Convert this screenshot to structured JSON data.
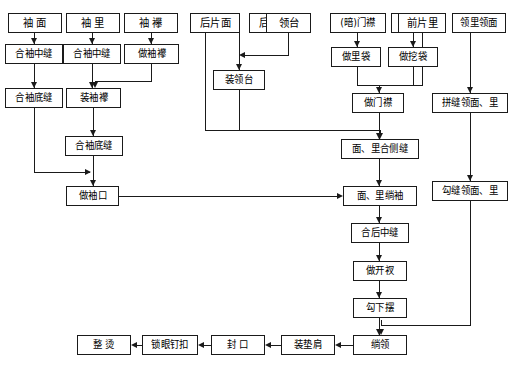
{
  "diagram": {
    "type": "flowchart",
    "orientation": "top-to-bottom",
    "line_color": "#1a1a1a",
    "box_fill": "#ffffff",
    "nodes": [
      {
        "id": "n01",
        "label": "袖 面",
        "x": 8,
        "y": 13,
        "w": 54,
        "h": 20,
        "fs": 11
      },
      {
        "id": "n02",
        "label": "袖 里",
        "x": 66,
        "y": 13,
        "w": 54,
        "h": 20,
        "fs": 11
      },
      {
        "id": "n03",
        "label": "袖 襻",
        "x": 124,
        "y": 13,
        "w": 54,
        "h": 20,
        "fs": 11
      },
      {
        "id": "n04",
        "label": "后片面",
        "x": 190,
        "y": 13,
        "w": 50,
        "h": 20,
        "fs": 11
      },
      {
        "id": "n05",
        "label": "后片里",
        "x": 249,
        "y": 13,
        "w": 50,
        "h": 20,
        "fs": 11
      },
      {
        "id": "n06",
        "label": "领台",
        "x": 307,
        "y": 13,
        "w": 45,
        "h": 20,
        "fs": 11
      },
      {
        "id": "n07",
        "label": "(暗)门襟",
        "x": 332,
        "y": 13,
        "w": 56,
        "h": 20,
        "fs": 10
      },
      {
        "id": "n08",
        "label": "前片面",
        "x": 395,
        "y": 13,
        "w": 50,
        "h": 20,
        "fs": 11
      },
      {
        "id": "n09",
        "label": "前片里",
        "x": 452,
        "y": 13,
        "w": 50,
        "h": 20,
        "fs": 11
      },
      {
        "id": "n10",
        "label": "领里领面",
        "x": 455,
        "y": 13,
        "w": 53,
        "h": 20,
        "fs": 10
      },
      {
        "id": "n11",
        "label": "合袖中缝",
        "x": 5,
        "y": 44,
        "w": 58,
        "h": 20,
        "fs": 10
      },
      {
        "id": "n12",
        "label": "合袖中缝",
        "x": 63,
        "y": 44,
        "w": 58,
        "h": 20,
        "fs": 10
      },
      {
        "id": "n13",
        "label": "做袖襻",
        "x": 124,
        "y": 44,
        "w": 55,
        "h": 20,
        "fs": 10
      },
      {
        "id": "n14",
        "label": "做里袋",
        "x": 333,
        "y": 47,
        "w": 50,
        "h": 20,
        "fs": 10
      },
      {
        "id": "n15",
        "label": "做挖袋",
        "x": 390,
        "y": 47,
        "w": 50,
        "h": 20,
        "fs": 10
      },
      {
        "id": "n16",
        "label": "装领台",
        "x": 213,
        "y": 70,
        "w": 52,
        "h": 20,
        "fs": 10
      },
      {
        "id": "n17",
        "label": "合袖底缝",
        "x": 5,
        "y": 88,
        "w": 58,
        "h": 20,
        "fs": 10
      },
      {
        "id": "n18",
        "label": "装袖襻",
        "x": 66,
        "y": 88,
        "w": 55,
        "h": 20,
        "fs": 10
      },
      {
        "id": "n19",
        "label": "做门襟",
        "x": 352,
        "y": 93,
        "w": 52,
        "h": 20,
        "fs": 10
      },
      {
        "id": "n20",
        "label": "拼缝领面、里",
        "x": 432,
        "y": 93,
        "w": 74,
        "h": 20,
        "fs": 10
      },
      {
        "id": "n21",
        "label": "合袖底缝",
        "x": 65,
        "y": 136,
        "w": 58,
        "h": 20,
        "fs": 10
      },
      {
        "id": "n22",
        "label": "面、里合侧缝",
        "x": 343,
        "y": 139,
        "w": 74,
        "h": 20,
        "fs": 10
      },
      {
        "id": "n23",
        "label": "做袖口",
        "x": 66,
        "y": 186,
        "w": 53,
        "h": 20,
        "fs": 10
      },
      {
        "id": "n24",
        "label": "面、里绱袖",
        "x": 345,
        "y": 186,
        "w": 70,
        "h": 20,
        "fs": 10
      },
      {
        "id": "n25",
        "label": "勾缝领面、里",
        "x": 432,
        "y": 181,
        "w": 74,
        "h": 20,
        "fs": 10
      },
      {
        "id": "n26",
        "label": "合后中缝",
        "x": 351,
        "y": 223,
        "w": 58,
        "h": 20,
        "fs": 10
      },
      {
        "id": "n27",
        "label": "做开衩",
        "x": 353,
        "y": 261,
        "w": 54,
        "h": 20,
        "fs": 10
      },
      {
        "id": "n28",
        "label": "勾下摆",
        "x": 353,
        "y": 298,
        "w": 54,
        "h": 20,
        "fs": 10
      },
      {
        "id": "n29",
        "label": "绱领",
        "x": 353,
        "y": 335,
        "w": 54,
        "h": 20,
        "fs": 10
      },
      {
        "id": "n30",
        "label": "装垫肩",
        "x": 281,
        "y": 335,
        "w": 54,
        "h": 20,
        "fs": 10
      },
      {
        "id": "n31",
        "label": "封 口",
        "x": 211,
        "y": 335,
        "w": 54,
        "h": 20,
        "fs": 10
      },
      {
        "id": "n32",
        "label": "锁眼钉扣",
        "x": 142,
        "y": 335,
        "w": 56,
        "h": 20,
        "fs": 10
      },
      {
        "id": "n33",
        "label": "整 烫",
        "x": 77,
        "y": 335,
        "w": 54,
        "h": 20,
        "fs": 10
      }
    ],
    "edges": [
      "袖面 → 合袖中缝 → 合袖底缝 → 做袖口",
      "袖里 → 合袖中缝 → 装袖襻 → 合袖底缝 → 做袖口",
      "袖襻 → 做袖襻 → 装袖襻",
      "后片面 → 面、里合侧缝",
      "后片里 → 装领台；领台 → 装领台",
      "装领台 → 面、里合侧缝",
      "(暗)门襟 → 做里袋 → 做门襟",
      "前片面 → 做挖袋 → 做门襟",
      "前片里 → 做门襟",
      "做门襟 → 面、里合侧缝 → 面、里绱袖 → 合后中缝 → 做开衩 → 勾下摆 → 绱领",
      "做袖口 → 面、里绱袖",
      "领里领面 → 拼缝领面、里 → 勾缝领面、里 → 绱领",
      "绱领 → 装垫肩 → 封口 → 锁眼钉扣 → 整烫"
    ]
  }
}
